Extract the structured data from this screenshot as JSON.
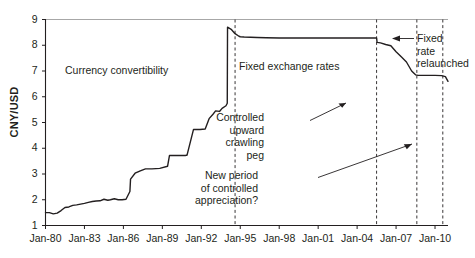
{
  "chart_data": {
    "type": "line",
    "title": "",
    "subtitle": "",
    "xlabel": "",
    "ylabel": "CNY/USD",
    "ylim": [
      1,
      9
    ],
    "xlim": [
      "Jan-80",
      "Jan-11"
    ],
    "grid": false,
    "legend": "none",
    "y_ticks": [
      "1",
      "2",
      "3",
      "4",
      "5",
      "6",
      "7",
      "8",
      "9"
    ],
    "x_ticks": [
      "Jan-80",
      "Jan-83",
      "Jan-86",
      "Jan-89",
      "Jan-92",
      "Jan-95",
      "Jan-98",
      "Jan-01",
      "Jan-04",
      "Jan-07",
      "Jan-10"
    ],
    "series": [
      {
        "name": "CNY per USD",
        "color": "#231f20",
        "x": [
          1980.0,
          1980.3,
          1980.6,
          1980.9,
          1981.2,
          1981.5,
          1981.8,
          1982.1,
          1982.4,
          1982.7,
          1983.0,
          1983.3,
          1983.6,
          1983.9,
          1984.2,
          1984.5,
          1984.8,
          1985.0,
          1985.3,
          1985.6,
          1985.9,
          1986.2,
          1986.5,
          1986.55,
          1986.9,
          1987.3,
          1987.7,
          1988.2,
          1988.8,
          1989.4,
          1989.55,
          1989.6,
          1990.2,
          1990.8,
          1990.85,
          1990.9,
          1991.4,
          1991.9,
          1992.3,
          1992.6,
          1992.9,
          1993.1,
          1993.4,
          1993.6,
          1993.9,
          1994.0,
          1994.02,
          1994.3,
          1994.6,
          1994.9,
          1995.0,
          1995.3,
          1995.8,
          1996.3,
          1997.0,
          1998.0,
          1999.0,
          2000.0,
          2001.0,
          2002.0,
          2003.0,
          2004.0,
          2005.0,
          2005.5,
          2005.54,
          2005.8,
          2006.2,
          2006.6,
          2007.0,
          2007.4,
          2007.8,
          2008.2,
          2008.5,
          2008.7,
          2009.0,
          2009.5,
          2010.0,
          2010.5,
          2010.8,
          2011.0
        ],
        "y": [
          1.5,
          1.5,
          1.45,
          1.48,
          1.58,
          1.7,
          1.72,
          1.78,
          1.8,
          1.83,
          1.86,
          1.9,
          1.93,
          1.95,
          1.96,
          2.02,
          1.98,
          2.0,
          2.04,
          2.0,
          2.0,
          2.02,
          2.32,
          2.8,
          3.03,
          3.12,
          3.2,
          3.2,
          3.22,
          3.3,
          3.72,
          3.72,
          3.72,
          3.72,
          3.73,
          3.73,
          4.73,
          4.73,
          4.75,
          5.15,
          5.32,
          5.45,
          5.43,
          5.55,
          5.65,
          5.75,
          8.7,
          8.62,
          8.45,
          8.35,
          8.33,
          8.32,
          8.31,
          8.3,
          8.29,
          8.28,
          8.28,
          8.28,
          8.28,
          8.28,
          8.28,
          8.28,
          8.28,
          8.28,
          8.11,
          8.09,
          8.03,
          7.98,
          7.75,
          7.55,
          7.35,
          7.0,
          6.85,
          6.83,
          6.83,
          6.83,
          6.83,
          6.82,
          6.78,
          6.6
        ]
      }
    ],
    "vertical_markers": [
      {
        "label": "Jan-95",
        "x": 1994.6
      },
      {
        "label": "Jul-05",
        "x": 2005.5
      },
      {
        "label": "Jul-08",
        "x": 2008.6
      },
      {
        "label": "Jan-10",
        "x": 2010.6
      }
    ],
    "annotations": [
      {
        "name": "currency-convertibility",
        "text": "Currency convertibility",
        "lines": [
          "Currency convertibility"
        ],
        "x": 65,
        "y": 64,
        "align": "left"
      },
      {
        "name": "fixed-exchange-rates",
        "text": "Fixed exchange rates",
        "lines": [
          "Fixed exchange rates"
        ],
        "x": 239,
        "y": 60,
        "align": "left"
      },
      {
        "name": "controlled-upward-crawling-peg",
        "text": "Controlled upward crawling peg",
        "lines": [
          "Controlled",
          "upward",
          "crawling",
          "peg"
        ],
        "x": 264,
        "y": 111,
        "align": "right"
      },
      {
        "name": "new-period-of-controlled-appreciation",
        "text": "New period of controlled appreciation?",
        "lines": [
          "New period",
          "of controlled",
          "appreciation?"
        ],
        "x": 258,
        "y": 169,
        "align": "right"
      },
      {
        "name": "fixed-rate-relaunched",
        "text": "Fixed rate relaunched",
        "lines": [
          "Fixed",
          "rate",
          "relaunched"
        ],
        "x": 417,
        "y": 32,
        "align": "left"
      }
    ]
  },
  "colors": {
    "line": "#231f20",
    "axis": "#231f20",
    "top_rule": "#a7a7a7",
    "dashed_marker": "#231f20",
    "background": "#ffffff"
  }
}
